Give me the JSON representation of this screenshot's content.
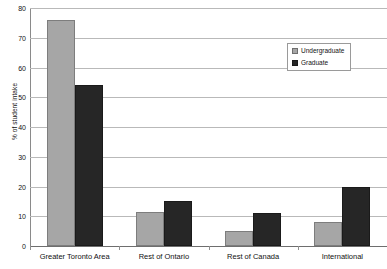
{
  "chart_data": {
    "type": "bar",
    "title": "",
    "xlabel": "",
    "ylabel": "% of student intake",
    "ylim": [
      0,
      80
    ],
    "yticks": [
      0,
      10,
      20,
      30,
      40,
      50,
      60,
      70,
      80
    ],
    "grid": true,
    "legend_position": "top-right",
    "categories": [
      "Greater Toronto Area",
      "Rest of Ontario",
      "Rest of Canada",
      "International"
    ],
    "series": [
      {
        "name": "Undergraduate",
        "color": "#a6a6a6",
        "values": [
          76,
          11.5,
          5,
          8
        ]
      },
      {
        "name": "Graduate",
        "color": "#262626",
        "values": [
          54,
          15,
          11,
          20
        ]
      }
    ]
  },
  "legend": {
    "items": [
      {
        "label": "Undergraduate",
        "swatch": "undergraduate-swatch"
      },
      {
        "label": "Graduate",
        "swatch": "graduate-swatch"
      }
    ]
  }
}
